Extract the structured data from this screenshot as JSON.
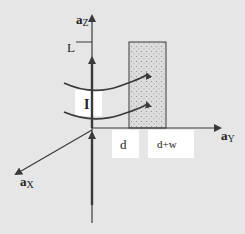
{
  "diagram": {
    "colors": {
      "background": "#e6e6e6",
      "axis": "#3a3a3a",
      "label_box": "#ffffff",
      "loop_fill": "#d9d9d9",
      "loop_dots": "#9a9a9a"
    },
    "axes": {
      "z": {
        "label_main": "a",
        "label_sub": "Z"
      },
      "y": {
        "label_main": "a",
        "label_sub": "Y"
      },
      "x": {
        "label_main": "a",
        "label_sub": "X"
      }
    },
    "labels": {
      "height": "L",
      "current": "I",
      "inner_edge": "d",
      "outer_edge": "d+w"
    }
  }
}
